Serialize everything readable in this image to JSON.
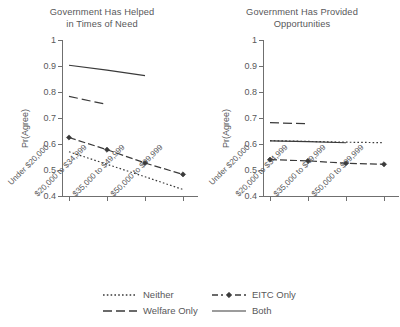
{
  "chart_data": {
    "type": "line",
    "title": "",
    "panels": [
      {
        "title_line1": "Government Has Helped",
        "title_line2": "in Times of Need",
        "ylabel": "Pr(Agree)",
        "ylim": [
          0.4,
          1.0
        ],
        "yticks": [
          "0.4",
          "0.5",
          "0.6",
          "0.7",
          "0.8",
          "0.9",
          "1"
        ],
        "ytick_values": [
          0.4,
          0.5,
          0.6,
          0.7,
          0.8,
          0.9,
          1.0
        ],
        "categories": [
          "Under $20,000",
          "$20,000 to $34,999",
          "$35,000 to $49,999",
          "$50,000 to $99,999"
        ],
        "series": [
          {
            "name": "Neither",
            "style": "dotted",
            "marker": "none",
            "values": [
              0.57,
              0.522,
              0.474,
              0.425
            ]
          },
          {
            "name": "EITC Only",
            "style": "dashdot",
            "marker": "diamond",
            "values": [
              0.625,
              0.578,
              0.527,
              0.483
            ]
          },
          {
            "name": "Welfare Only",
            "style": "dashed",
            "marker": "none",
            "values": [
              0.783,
              0.752,
              null,
              null
            ]
          },
          {
            "name": "Both",
            "style": "solid",
            "marker": "none",
            "values": [
              0.903,
              0.884,
              0.863,
              null
            ]
          }
        ]
      },
      {
        "title_line1": "Government Has Provided",
        "title_line2": "Opportunities",
        "ylabel": "Pr(Agree)",
        "ylim": [
          0.4,
          1.0
        ],
        "yticks": [
          "0.4",
          "0.5",
          "0.6",
          "0.7",
          "0.8",
          "0.9",
          "1"
        ],
        "ytick_values": [
          0.4,
          0.5,
          0.6,
          0.7,
          0.8,
          0.9,
          1.0
        ],
        "categories": [
          "Under $20,000",
          "$20,000 to $34,999",
          "$35,000 to $49,999",
          "$50,000 to $99,999"
        ],
        "series": [
          {
            "name": "Neither",
            "style": "dotted",
            "marker": "none",
            "values": [
              0.613,
              0.61,
              0.607,
              0.605
            ]
          },
          {
            "name": "EITC Only",
            "style": "dashdot",
            "marker": "diamond",
            "values": [
              0.54,
              0.535,
              0.526,
              0.522
            ]
          },
          {
            "name": "Welfare Only",
            "style": "dashed",
            "marker": "none",
            "values": [
              0.682,
              0.678,
              null,
              null
            ]
          },
          {
            "name": "Both",
            "style": "solid",
            "marker": "none",
            "values": [
              0.612,
              0.609,
              0.605,
              null
            ]
          }
        ]
      }
    ],
    "legend": {
      "position": "bottom",
      "entries": [
        {
          "label": "Neither",
          "style": "dotted",
          "marker": "none"
        },
        {
          "label": "EITC Only",
          "style": "dashdot",
          "marker": "diamond"
        },
        {
          "label": "Welfare Only",
          "style": "dashed",
          "marker": "none"
        },
        {
          "label": "Both",
          "style": "solid",
          "marker": "none"
        }
      ]
    },
    "colors": {
      "line": "#3a3a3a",
      "axis": "#6f6f6f",
      "text": "#58585a",
      "background": "#ffffff"
    },
    "grid": false
  }
}
